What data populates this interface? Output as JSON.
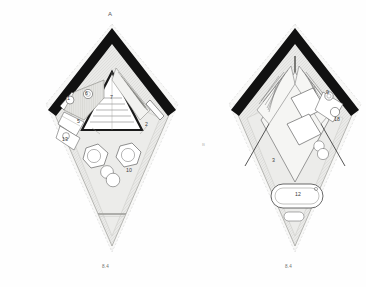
{
  "drawing": {
    "kind": "architectural-floor-plan-pair",
    "section_marker": "A",
    "middle_mark": "B"
  },
  "palette": {
    "wall_black": "#111111",
    "floor_fill": "#e9e9e7",
    "hatch_line": "#c9c9c6",
    "thin_line": "#6e6e6e",
    "dash_line": "#bdbdbd",
    "furniture_line": "#4a4a4a",
    "label_text": "#3a3a3a",
    "paper": "#fefefe"
  },
  "plans": [
    {
      "id": "plan-left",
      "name": "ground-floor-plan",
      "top_label": "A",
      "dimension_label": "8.4",
      "rooms": [
        {
          "key": "entry",
          "number": "1"
        },
        {
          "key": "terrace",
          "number": "2"
        },
        {
          "key": "kitchen-unit",
          "number": "5"
        },
        {
          "key": "wc",
          "number": "6"
        },
        {
          "key": "stair",
          "number": "7"
        },
        {
          "key": "living",
          "number": "10"
        },
        {
          "key": "wash",
          "number": "13"
        }
      ]
    },
    {
      "id": "plan-right",
      "name": "upper-floor-plan",
      "top_label": "",
      "dimension_label": "8.4",
      "rooms": [
        {
          "key": "bedroom",
          "number": "3"
        },
        {
          "key": "bathtub",
          "number": "12"
        },
        {
          "key": "basin",
          "number": "18"
        },
        {
          "key": "closet",
          "number": "9"
        }
      ]
    }
  ]
}
